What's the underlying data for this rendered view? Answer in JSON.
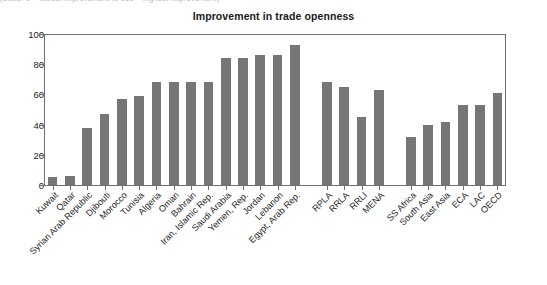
{
  "caption_strip": "(scale: 0 = lowest improvement to 100 = highest improvement)",
  "chart_data": {
    "type": "bar",
    "title": "Improvement in trade openness",
    "xlabel": "",
    "ylabel": "",
    "ylim": [
      0,
      100
    ],
    "yticks": [
      0,
      20,
      40,
      60,
      80,
      100
    ],
    "grid": false,
    "legend": "none",
    "bar_color": "#767676",
    "axis_color": "#6f6f6f",
    "categories": [
      "Kuwait",
      "Qatar",
      "Syrian Arab Republic",
      "Djibouti",
      "Morocco",
      "Tunisia",
      "Algeria",
      "Oman",
      "Bahrain",
      "Iran, Islamic Rep.",
      "Saudi Arabia",
      "Yemen, Rep.",
      "Jordan",
      "Lebanon",
      "Egypt, Arab Rep.",
      "RPLA",
      "RRLA",
      "RRLI",
      "MENA",
      "SS Africa",
      "South Asia",
      "East Asia",
      "ECA",
      "LAC",
      "OECD"
    ],
    "values": [
      5,
      6,
      38,
      47,
      57,
      59,
      68,
      68,
      68,
      68,
      84,
      84,
      86,
      86,
      93,
      68,
      65,
      45,
      63,
      32,
      40,
      42,
      53,
      53,
      61
    ],
    "group_breaks": [
      15,
      19
    ]
  }
}
